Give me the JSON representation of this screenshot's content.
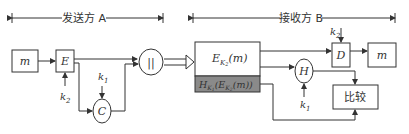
{
  "sender": {
    "label": "发送方 A",
    "message": "m",
    "encrypt": "E",
    "key_encrypt": "k",
    "key_encrypt_sub": "2",
    "mac": "C",
    "key_mac": "k",
    "key_mac_sub": "1",
    "concat": "||"
  },
  "receiver": {
    "label": "接收方 B",
    "cipher_block": {
      "main": "E",
      "sub": "K",
      "subsub": "2",
      "arg": "(m)"
    },
    "mac_block": {
      "main": "H",
      "sub": "K",
      "subsub": "1",
      "arg_pre": "(E",
      "arg_sub": "K",
      "arg_subsub": "2",
      "arg_post": "(m))"
    },
    "hash": "H",
    "key_hash": "k",
    "key_hash_sub": "1",
    "decrypt": "D",
    "key_decrypt": "k",
    "key_decrypt_sub": "2",
    "output": "m",
    "compare": "比较"
  },
  "colors": {
    "stroke": "#333333",
    "mac_block_fill": "#8a8a8a"
  }
}
